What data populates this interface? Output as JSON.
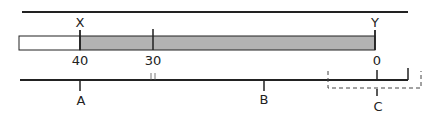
{
  "diagram": {
    "colors": {
      "line": "#222222",
      "bar_fill": "#b3b3b3",
      "bar_empty": "#ffffff"
    },
    "markers": {
      "x": "X",
      "y": "Y"
    },
    "scale": {
      "left": "40",
      "mid": "30",
      "right": "0"
    },
    "points": {
      "a": "A",
      "b": "B",
      "c": "C"
    }
  }
}
